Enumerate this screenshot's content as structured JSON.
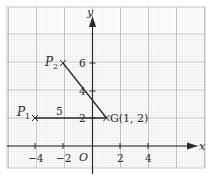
{
  "figure": {
    "axes": {
      "x_label": "x",
      "y_label": "y",
      "origin_label": "O",
      "x_ticks": [
        {
          "value": -4,
          "label": "−4"
        },
        {
          "value": -2,
          "label": "−2"
        },
        {
          "value": 2,
          "label": "2"
        },
        {
          "value": 4,
          "label": "4"
        }
      ],
      "y_ticks": [
        {
          "value": 2,
          "label": "2"
        },
        {
          "value": 4,
          "label": "4"
        },
        {
          "value": 6,
          "label": "6"
        }
      ]
    },
    "points": {
      "P1": {
        "name": "P",
        "sub": "1",
        "x": -4,
        "y": 2
      },
      "P2": {
        "name": "P",
        "sub": "2",
        "x": -2,
        "y": 6
      },
      "G": {
        "label": "G(1, 2)",
        "x": 1,
        "y": 2
      }
    },
    "segments": [
      {
        "from": "P1",
        "to": "G",
        "label": "5"
      },
      {
        "from": "P2",
        "to": "G",
        "label": ""
      }
    ],
    "colors": {
      "grid_minor": "#e2e2e2",
      "grid_major": "#b9b9b9",
      "axis": "#2a2a2a",
      "line": "#2a2a2a"
    }
  }
}
